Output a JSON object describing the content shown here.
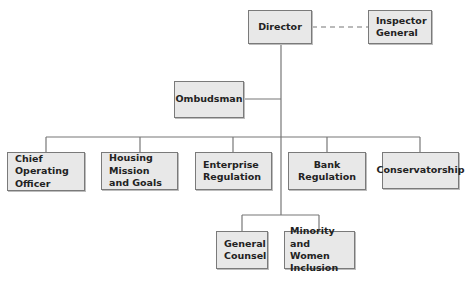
{
  "chart": {
    "nodes": {
      "director": "Director",
      "inspector_general": "Inspector\nGeneral",
      "ombudsman": "Ombudsman",
      "coo": "Chief Operating\nOfficer",
      "housing": "Housing Mission\nand Goals",
      "enterprise": "Enterprise\nRegulation",
      "bank": "Bank Regulation",
      "conservatorship": "Conservatorship",
      "general_counsel": "General\nCounsel",
      "minority": "Minority and\nWomen\nInclusion"
    },
    "colors": {
      "box_fill": "#e8e8e8",
      "box_border": "#7a7a7a",
      "line": "#777777"
    }
  }
}
